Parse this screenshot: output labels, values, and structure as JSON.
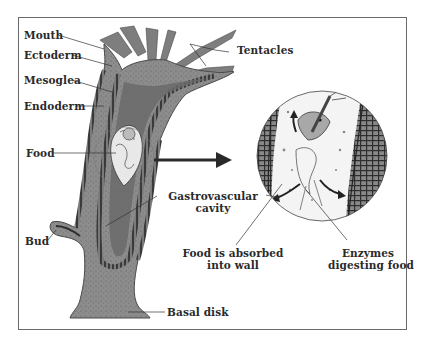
{
  "diagram": {
    "labels": {
      "mouth": "Mouth",
      "ectoderm": "Ectoderm",
      "mesoglea": "Mesoglea",
      "endoderm": "Endoderm",
      "food": "Food",
      "bud": "Bud",
      "tentacles": "Tentacles",
      "gastrovascular_line1": "Gastrovascular",
      "gastrovascular_line2": "cavity",
      "absorbed_line1": "Food is absorbed",
      "absorbed_line2": "into wall",
      "enzymes_line1": "Enzymes",
      "enzymes_line2": "digesting food",
      "basal_disk": "Basal disk"
    },
    "colors": {
      "body_fill": "#8a8a8a",
      "body_dark": "#5a5a5a",
      "wall_stripe": "#3a3a3a",
      "inset_bg": "#f2f2f2",
      "frame": "#6a6a6a",
      "label_text": "#2a2a2a"
    }
  }
}
